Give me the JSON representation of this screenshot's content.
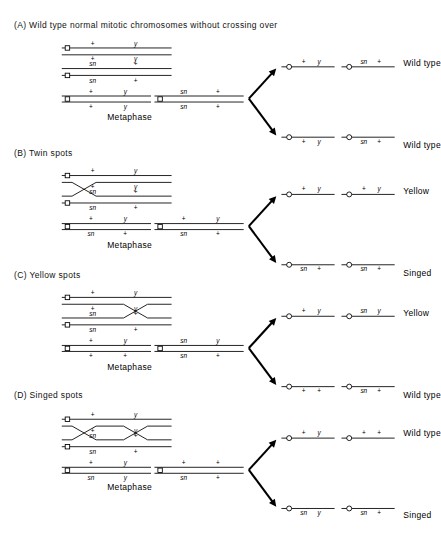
{
  "figure": {
    "alleles": {
      "plus": "+",
      "yellow": "y",
      "singed": "sn"
    },
    "metaphase_label": "Metaphase"
  },
  "panels": [
    {
      "id": "A",
      "title": "(A) Wild type normal mitotic chromosomes without crossing over",
      "crossover": "none",
      "prophase": {
        "chromosome_1": {
          "chromatid_top": [
            "+",
            "y"
          ],
          "chromatid_bottom": [
            "+",
            "y"
          ]
        },
        "chromosome_2": {
          "chromatid_top": [
            "sn",
            "+"
          ],
          "chromatid_bottom": [
            "sn",
            "+"
          ]
        }
      },
      "metaphase": {
        "chromosome_1": {
          "chromatid_top": [
            "+",
            "y"
          ],
          "chromatid_bottom": [
            "+",
            "y"
          ]
        },
        "chromosome_2": {
          "chromatid_top": [
            "sn",
            "+"
          ],
          "chromatid_bottom": [
            "sn",
            "+"
          ]
        },
        "label": "Metaphase"
      },
      "daughters": [
        {
          "position": "top",
          "chromosome_left": [
            "+",
            "y"
          ],
          "chromosome_right": [
            "sn",
            "+"
          ],
          "phenotype": "Wild type"
        },
        {
          "position": "bottom",
          "chromosome_left": [
            "+",
            "y"
          ],
          "chromosome_right": [
            "sn",
            "+"
          ],
          "phenotype": "Wild type"
        }
      ]
    },
    {
      "id": "B",
      "title": "(B) Twin spots",
      "crossover": "single-left",
      "prophase": {
        "chromosome_1": {
          "chromatid_top": [
            "+",
            "y"
          ],
          "chromatid_bottom": [
            "+",
            "y"
          ]
        },
        "chromosome_2": {
          "chromatid_top": [
            "sn",
            "+"
          ],
          "chromatid_bottom": [
            "sn",
            "+"
          ]
        }
      },
      "metaphase": {
        "chromosome_1": {
          "chromatid_top": [
            "+",
            "y"
          ],
          "chromatid_bottom": [
            "sn",
            "+"
          ]
        },
        "chromosome_2": {
          "chromatid_top": [
            "+",
            "y"
          ],
          "chromatid_bottom": [
            "sn",
            "+"
          ]
        },
        "label": "Metaphase"
      },
      "daughters": [
        {
          "position": "top",
          "chromosome_left": [
            "+",
            "y"
          ],
          "chromosome_right": [
            "+",
            "y"
          ],
          "phenotype": "Yellow"
        },
        {
          "position": "bottom",
          "chromosome_left": [
            "sn",
            "+"
          ],
          "chromosome_right": [
            "sn",
            "+"
          ],
          "phenotype": "Singed"
        }
      ]
    },
    {
      "id": "C",
      "title": "(C) Yellow spots",
      "crossover": "single-right",
      "prophase": {
        "chromosome_1": {
          "chromatid_top": [
            "+",
            "y"
          ],
          "chromatid_bottom": [
            "+",
            "y"
          ]
        },
        "chromosome_2": {
          "chromatid_top": [
            "sn",
            "+"
          ],
          "chromatid_bottom": [
            "sn",
            "+"
          ]
        }
      },
      "metaphase": {
        "chromosome_1": {
          "chromatid_top": [
            "+",
            "y"
          ],
          "chromatid_bottom": [
            "+",
            "+"
          ]
        },
        "chromosome_2": {
          "chromatid_top": [
            "sn",
            "y"
          ],
          "chromatid_bottom": [
            "sn",
            "+"
          ]
        },
        "label": "Metaphase"
      },
      "daughters": [
        {
          "position": "top",
          "chromosome_left": [
            "+",
            "y"
          ],
          "chromosome_right": [
            "sn",
            "y"
          ],
          "phenotype": "Yellow"
        },
        {
          "position": "bottom",
          "chromosome_left": [
            "+",
            "+"
          ],
          "chromosome_right": [
            "sn",
            "+"
          ],
          "phenotype": "Wild type"
        }
      ]
    },
    {
      "id": "D",
      "title": "(D) Singed spots",
      "crossover": "double",
      "prophase": {
        "chromosome_1": {
          "chromatid_top": [
            "+",
            "y"
          ],
          "chromatid_bottom": [
            "+",
            "y"
          ]
        },
        "chromosome_2": {
          "chromatid_top": [
            "sn",
            "+"
          ],
          "chromatid_bottom": [
            "sn",
            "+"
          ]
        }
      },
      "metaphase": {
        "chromosome_1": {
          "chromatid_top": [
            "+",
            "y"
          ],
          "chromatid_bottom": [
            "sn",
            "y"
          ]
        },
        "chromosome_2": {
          "chromatid_top": [
            "+",
            "+"
          ],
          "chromatid_bottom": [
            "sn",
            "+"
          ]
        },
        "label": "Metaphase"
      },
      "daughters": [
        {
          "position": "top",
          "chromosome_left": [
            "+",
            "y"
          ],
          "chromosome_right": [
            "+",
            "+"
          ],
          "phenotype": "Wild type"
        },
        {
          "position": "bottom",
          "chromosome_left": [
            "sn",
            "y"
          ],
          "chromosome_right": [
            "sn",
            "+"
          ],
          "phenotype": "Singed"
        }
      ]
    }
  ]
}
